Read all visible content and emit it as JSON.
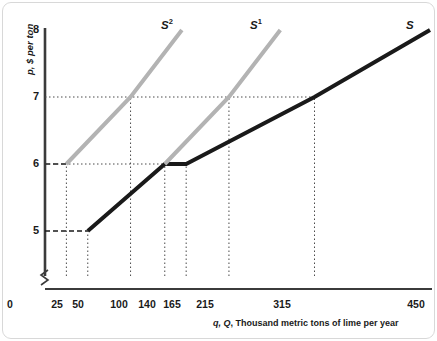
{
  "chart_data": {
    "type": "line",
    "title": "",
    "xlabel": "q, Q, Thousand metric tons of lime per year",
    "ylabel": "p, $ per ton",
    "xlim": [
      0,
      450
    ],
    "ylim": [
      4.6,
      8.2
    ],
    "xticks": [
      0,
      25,
      50,
      100,
      140,
      165,
      215,
      315,
      450
    ],
    "xticklabels": [
      "0",
      "25",
      "50",
      "100",
      "140",
      "165",
      "215",
      "315",
      "450"
    ],
    "yticks": [
      5,
      6,
      7,
      8
    ],
    "yticklabels": [
      "5",
      "6",
      "7",
      "8"
    ],
    "grid": false,
    "axis_break_y": true,
    "legend": "inline-labels",
    "series": [
      {
        "name": "S",
        "label": "S",
        "color": "#1a1a1a",
        "width": 4,
        "points": [
          {
            "x": 50,
            "y": 5
          },
          {
            "x": 140,
            "y": 6
          },
          {
            "x": 165,
            "y": 6
          },
          {
            "x": 315,
            "y": 7
          },
          {
            "x": 450,
            "y": 8
          }
        ]
      },
      {
        "name": "S2",
        "label": "S",
        "superscript": "2",
        "color": "#b3b3b3",
        "width": 4,
        "points": [
          {
            "x": 25,
            "y": 6
          },
          {
            "x": 100,
            "y": 7
          },
          {
            "x": 160,
            "y": 8
          }
        ]
      },
      {
        "name": "S1",
        "label": "S",
        "superscript": "1",
        "color": "#b3b3b3",
        "width": 4,
        "points": [
          {
            "x": 140,
            "y": 6
          },
          {
            "x": 215,
            "y": 7
          },
          {
            "x": 275,
            "y": 8
          }
        ]
      }
    ],
    "guide_lines": [
      {
        "type": "dashed-h",
        "y": 6,
        "from_x": 0,
        "to_x": 25
      },
      {
        "type": "dashed-h",
        "y": 5,
        "from_x": 0,
        "to_x": 50
      },
      {
        "type": "dotted-h",
        "y": 7,
        "from_x": 0,
        "to_x": 315
      },
      {
        "type": "dotted-h",
        "y": 6,
        "from_x": 25,
        "to_x": 165
      },
      {
        "type": "dotted-v",
        "x": 25
      },
      {
        "type": "dotted-v",
        "x": 50
      },
      {
        "type": "dotted-v",
        "x": 100
      },
      {
        "type": "dotted-v",
        "x": 140
      },
      {
        "type": "dotted-v",
        "x": 165
      },
      {
        "type": "dotted-v",
        "x": 215
      },
      {
        "type": "dotted-v",
        "x": 315
      }
    ],
    "annotations": [
      {
        "text": "S2",
        "x": 112,
        "y": 8.2
      },
      {
        "text": "S1",
        "x": 228,
        "y": 8.2
      },
      {
        "text": "S",
        "x": 462,
        "y": 8.05
      }
    ]
  },
  "axes": {
    "y_title": "p, $ per ton",
    "x_title_prefix": "q, Q",
    "x_title_rest": ", Thousand metric tons of lime per year",
    "origin_label": "0"
  },
  "curve_labels": {
    "s2_base": "S",
    "s2_sup": "2",
    "s1_base": "S",
    "s1_sup": "1",
    "s_base": "S"
  },
  "colors": {
    "dark_curve": "#1a1a1a",
    "gray_curve": "#b3b3b3",
    "axis": "#3b3b3b",
    "guide": "#4a4a4a",
    "background": "#ffffff",
    "card_border": "#d8d8d8"
  }
}
